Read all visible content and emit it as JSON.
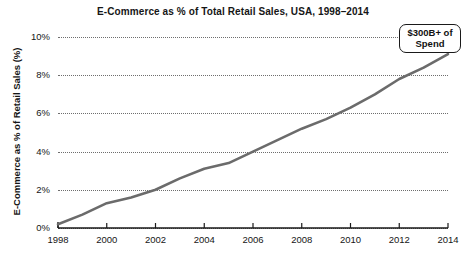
{
  "chart_data": {
    "type": "line",
    "title": "E-Commerce as % of Total Retail Sales, USA, 1998–2014",
    "xlabel": "",
    "ylabel": "E-Commerce as % of Retail Sales (%)",
    "xlim": [
      1998,
      2014
    ],
    "ylim": [
      0,
      10
    ],
    "grid": true,
    "legend": null,
    "x": [
      1998,
      1999,
      2000,
      2001,
      2002,
      2003,
      2004,
      2005,
      2006,
      2007,
      2008,
      2009,
      2010,
      2011,
      2012,
      2013,
      2014
    ],
    "values": [
      0.2,
      0.7,
      1.3,
      1.6,
      2.0,
      2.6,
      3.1,
      3.4,
      4.0,
      4.6,
      5.2,
      5.7,
      6.3,
      7.0,
      7.8,
      8.4,
      9.1
    ],
    "series": [
      {
        "name": "E-Commerce share of retail sales",
        "color": "#6b6b6b",
        "values": [
          0.2,
          0.7,
          1.3,
          1.6,
          2.0,
          2.6,
          3.1,
          3.4,
          4.0,
          4.6,
          5.2,
          5.7,
          6.3,
          7.0,
          7.8,
          8.4,
          9.1
        ]
      }
    ],
    "yticks": [
      0,
      2,
      4,
      6,
      8,
      10
    ],
    "ytick_labels": [
      "0%",
      "2%",
      "4%",
      "6%",
      "8%",
      "10%"
    ],
    "xticks": [
      1998,
      2000,
      2002,
      2004,
      2006,
      2008,
      2010,
      2012,
      2014
    ],
    "xtick_labels": [
      "1998",
      "2000",
      "2002",
      "2004",
      "2006",
      "2008",
      "2010",
      "2012",
      "2014"
    ],
    "annotations": [
      {
        "name": "spend-callout",
        "lines": [
          "$300B+ of",
          "Spend"
        ],
        "target_x": 2014,
        "target_y": 9.1
      }
    ]
  }
}
